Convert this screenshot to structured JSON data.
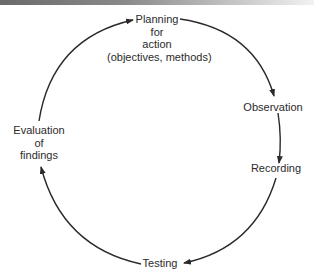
{
  "diagram": {
    "type": "cycle",
    "stroke_color": "#2a2a2a",
    "nodes": [
      {
        "id": "planning",
        "lines": [
          "Planning",
          "for",
          "action",
          "(objectives, methods)"
        ]
      },
      {
        "id": "observation",
        "lines": [
          "Observation"
        ]
      },
      {
        "id": "recording",
        "lines": [
          "Recording"
        ]
      },
      {
        "id": "testing",
        "lines": [
          "Testing"
        ]
      },
      {
        "id": "evaluation",
        "lines": [
          "Evaluation",
          "of",
          "findings"
        ]
      }
    ],
    "edges": [
      {
        "from": "planning",
        "to": "observation"
      },
      {
        "from": "observation",
        "to": "recording"
      },
      {
        "from": "recording",
        "to": "testing"
      },
      {
        "from": "testing",
        "to": "evaluation"
      },
      {
        "from": "evaluation",
        "to": "planning"
      }
    ]
  }
}
